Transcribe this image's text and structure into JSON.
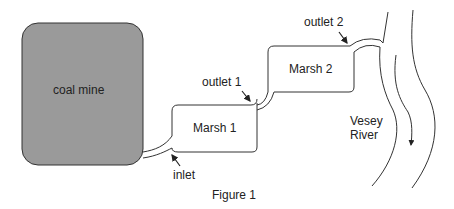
{
  "diagram": {
    "caption": "Figure 1",
    "nodes": {
      "coal_mine": {
        "label": "coal mine",
        "fill": "#9a9a9a"
      },
      "marsh1": {
        "label": "Marsh 1"
      },
      "marsh2": {
        "label": "Marsh 2"
      },
      "river": {
        "label_line1": "Vesey",
        "label_line2": "River"
      }
    },
    "annotations": {
      "inlet": "inlet",
      "outlet1": "outlet 1",
      "outlet2": "outlet 2"
    },
    "flow": [
      "coal mine",
      "inlet",
      "Marsh 1",
      "outlet 1",
      "Marsh 2",
      "outlet 2",
      "Vesey River"
    ]
  }
}
